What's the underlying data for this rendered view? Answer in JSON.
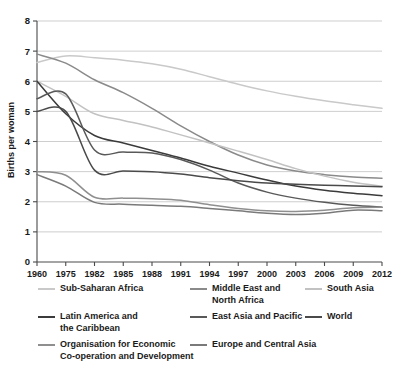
{
  "chart_data": {
    "type": "line",
    "title": "",
    "xlabel": "",
    "ylabel": "Births per woman",
    "ylim": [
      0,
      8
    ],
    "yticks": [
      0,
      1,
      2,
      3,
      4,
      5,
      6,
      7,
      8
    ],
    "grid": true,
    "legend_position": "bottom",
    "x": [
      1960,
      1975,
      1982,
      1985,
      1988,
      1991,
      1994,
      1997,
      2000,
      2003,
      2006,
      2009,
      2012
    ],
    "categories": [
      "1960",
      "1975",
      "1982",
      "1985",
      "1988",
      "1991",
      "1994",
      "1997",
      "2000",
      "2003",
      "2006",
      "2009",
      "2012"
    ],
    "series": [
      {
        "name": "Sub-Saharan Africa",
        "color": "#c9c9c9",
        "values": [
          6.62,
          6.84,
          6.78,
          6.7,
          6.58,
          6.4,
          6.15,
          5.9,
          5.68,
          5.5,
          5.35,
          5.22,
          5.1
        ]
      },
      {
        "name": "Middle East and North Africa",
        "color": "#8a8a8a",
        "values": [
          6.9,
          6.6,
          6.05,
          5.62,
          5.1,
          4.52,
          4.0,
          3.55,
          3.22,
          3.02,
          2.9,
          2.82,
          2.78
        ]
      },
      {
        "name": "South Asia",
        "color": "#c2c2c2",
        "values": [
          6.0,
          5.5,
          4.92,
          4.7,
          4.48,
          4.22,
          3.95,
          3.68,
          3.4,
          3.1,
          2.85,
          2.65,
          2.52
        ]
      },
      {
        "name": "Latin America and the Caribbean",
        "color": "#3b3b3b",
        "values": [
          6.0,
          4.92,
          4.2,
          3.95,
          3.7,
          3.45,
          3.18,
          2.95,
          2.72,
          2.52,
          2.38,
          2.28,
          2.2
        ]
      },
      {
        "name": "East Asia and Pacific",
        "color": "#595959",
        "values": [
          5.42,
          5.58,
          3.72,
          3.65,
          3.62,
          3.4,
          3.05,
          2.62,
          2.32,
          2.12,
          1.98,
          1.88,
          1.82
        ]
      },
      {
        "name": "World",
        "color": "#4a4a4a",
        "values": [
          5.0,
          5.0,
          3.05,
          3.02,
          3.0,
          2.92,
          2.8,
          2.7,
          2.62,
          2.58,
          2.55,
          2.52,
          2.5
        ]
      },
      {
        "name": "Organisation for Economic Co-operation and Development",
        "color": "#8f8f8f",
        "values": [
          3.0,
          2.88,
          2.15,
          2.12,
          2.1,
          2.05,
          1.9,
          1.78,
          1.7,
          1.68,
          1.72,
          1.8,
          1.82
        ]
      },
      {
        "name": "Europe and Central Asia",
        "color": "#7a7a7a",
        "values": [
          2.9,
          2.52,
          1.98,
          1.92,
          1.88,
          1.85,
          1.78,
          1.7,
          1.62,
          1.58,
          1.62,
          1.72,
          1.7
        ]
      }
    ]
  },
  "legend": {
    "entries": [
      {
        "label": "Sub-Saharan Africa",
        "color": "#c9c9c9",
        "name": "sub-saharan-africa"
      },
      {
        "label": "Middle East and\nNorth Africa",
        "color": "#8a8a8a",
        "name": "middle-east-and-north-africa"
      },
      {
        "label": "South Asia",
        "color": "#c2c2c2",
        "name": "south-asia"
      },
      {
        "label": "Latin America and\nthe Caribbean",
        "color": "#3b3b3b",
        "name": "latin-america-and-the-caribbean"
      },
      {
        "label": "East Asia and Pacific",
        "color": "#595959",
        "name": "east-asia-and-pacific"
      },
      {
        "label": "World",
        "color": "#4a4a4a",
        "name": "world"
      },
      {
        "label": "Organisation for Economic\nCo-operation and Development",
        "color": "#8f8f8f",
        "name": "oecd"
      },
      {
        "label": "Europe and Central Asia",
        "color": "#7a7a7a",
        "name": "europe-and-central-asia"
      }
    ]
  }
}
